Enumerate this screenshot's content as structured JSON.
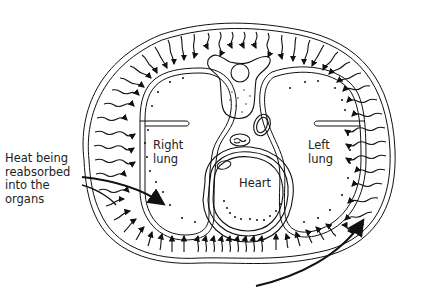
{
  "diagram": {
    "type": "cross-section",
    "colors": {
      "ink": "#111111",
      "background": "#ffffff",
      "label": "#222222"
    },
    "labels": {
      "annotation_lines": [
        "Heat being",
        "reabsorbed",
        "into the",
        "organs"
      ],
      "right_lung": [
        "Right",
        "lung"
      ],
      "left_lung": [
        "Left",
        "lung"
      ],
      "heart": "Heart"
    }
  }
}
